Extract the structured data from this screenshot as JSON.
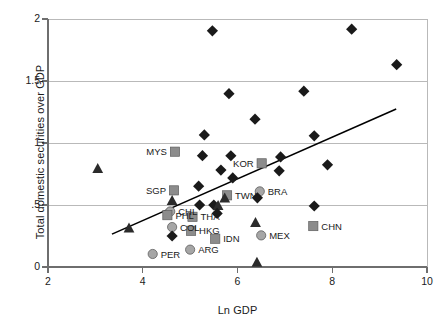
{
  "chart_data": {
    "type": "scatter",
    "title": "",
    "xlabel": "Ln GDP",
    "ylabel": "Total domestic securities over GDP",
    "xlim": [
      2,
      10
    ],
    "ylim": [
      0,
      2
    ],
    "xticks": [
      "2",
      "4",
      "6",
      "8",
      "10"
    ],
    "xtick_values": [
      2,
      4,
      6,
      8,
      10
    ],
    "yticks": [
      "0",
      ".5",
      "1",
      "1.5",
      "2"
    ],
    "ytick_values": [
      0,
      0.5,
      1,
      1.5,
      2
    ],
    "grid": "horizontal",
    "legend": "none",
    "marker_styles": {
      "diamond": {
        "shape": "diamond",
        "color": "#1a1a1a",
        "description": "black diamond"
      },
      "triangle": {
        "shape": "triangle",
        "color": "#2b2b2b",
        "description": "black triangle"
      },
      "square": {
        "shape": "square",
        "color": "#8c8c8c",
        "description": "gray square"
      },
      "circle": {
        "shape": "circle",
        "color": "#a6a6a6",
        "description": "gray circle"
      }
    },
    "trendline": {
      "x1": 3.35,
      "y1": 0.265,
      "x2": 9.35,
      "y2": 1.275,
      "color": "#000000"
    },
    "points": [
      {
        "label": "",
        "x": 5.47,
        "y": 1.905,
        "marker": "diamond"
      },
      {
        "label": "",
        "x": 8.41,
        "y": 1.918,
        "marker": "diamond"
      },
      {
        "label": "",
        "x": 9.36,
        "y": 1.632,
        "marker": "diamond"
      },
      {
        "label": "",
        "x": 5.82,
        "y": 1.398,
        "marker": "diamond"
      },
      {
        "label": "",
        "x": 7.4,
        "y": 1.418,
        "marker": "diamond"
      },
      {
        "label": "",
        "x": 6.37,
        "y": 1.192,
        "marker": "diamond"
      },
      {
        "label": "",
        "x": 5.3,
        "y": 1.065,
        "marker": "diamond"
      },
      {
        "label": "",
        "x": 7.62,
        "y": 1.058,
        "marker": "diamond"
      },
      {
        "label": "MYS",
        "x": 4.68,
        "y": 0.93,
        "marker": "square",
        "label_pos": "left"
      },
      {
        "label": "",
        "x": 5.26,
        "y": 0.898,
        "marker": "diamond"
      },
      {
        "label": "",
        "x": 5.86,
        "y": 0.897,
        "marker": "diamond"
      },
      {
        "label": "",
        "x": 6.91,
        "y": 0.888,
        "marker": "diamond"
      },
      {
        "label": "KOR",
        "x": 6.51,
        "y": 0.836,
        "marker": "square",
        "label_pos": "left"
      },
      {
        "label": "",
        "x": 7.9,
        "y": 0.824,
        "marker": "diamond"
      },
      {
        "label": "",
        "x": 3.05,
        "y": 0.795,
        "marker": "triangle"
      },
      {
        "label": "",
        "x": 5.65,
        "y": 0.782,
        "marker": "diamond"
      },
      {
        "label": "",
        "x": 6.88,
        "y": 0.776,
        "marker": "diamond"
      },
      {
        "label": "",
        "x": 5.9,
        "y": 0.718,
        "marker": "diamond"
      },
      {
        "label": "",
        "x": 5.18,
        "y": 0.652,
        "marker": "diamond"
      },
      {
        "label": "SGP",
        "x": 4.66,
        "y": 0.618,
        "marker": "square",
        "label_pos": "left"
      },
      {
        "label": "BRA",
        "x": 6.47,
        "y": 0.61,
        "marker": "circle",
        "label_pos": "right"
      },
      {
        "label": "TWN",
        "x": 5.78,
        "y": 0.578,
        "marker": "square",
        "label_pos": "right"
      },
      {
        "label": "",
        "x": 6.42,
        "y": 0.558,
        "marker": "diamond"
      },
      {
        "label": "",
        "x": 4.62,
        "y": 0.538,
        "marker": "triangle"
      },
      {
        "label": "",
        "x": 5.73,
        "y": 0.558,
        "marker": "triangle"
      },
      {
        "label": "",
        "x": 5.2,
        "y": 0.5,
        "marker": "diamond"
      },
      {
        "label": "",
        "x": 5.5,
        "y": 0.5,
        "marker": "diamond"
      },
      {
        "label": "",
        "x": 5.59,
        "y": 0.497,
        "marker": "triangle"
      },
      {
        "label": "",
        "x": 7.62,
        "y": 0.492,
        "marker": "diamond"
      },
      {
        "label": "CHL",
        "x": 4.58,
        "y": 0.448,
        "marker": "circle",
        "label_pos": "right"
      },
      {
        "label": "",
        "x": 5.57,
        "y": 0.432,
        "marker": "diamond"
      },
      {
        "label": "PHL",
        "x": 4.52,
        "y": 0.418,
        "marker": "square",
        "label_pos": "right"
      },
      {
        "label": "THA",
        "x": 5.05,
        "y": 0.405,
        "marker": "square",
        "label_pos": "right"
      },
      {
        "label": "",
        "x": 6.38,
        "y": 0.36,
        "marker": "triangle"
      },
      {
        "label": "CHN",
        "x": 7.6,
        "y": 0.33,
        "marker": "square",
        "label_pos": "right"
      },
      {
        "label": "COL",
        "x": 4.62,
        "y": 0.322,
        "marker": "circle",
        "label_pos": "right"
      },
      {
        "label": "",
        "x": 3.71,
        "y": 0.315,
        "marker": "triangle"
      },
      {
        "label": "HKG",
        "x": 5.02,
        "y": 0.292,
        "marker": "square",
        "label_pos": "right"
      },
      {
        "label": "MEX",
        "x": 6.5,
        "y": 0.255,
        "marker": "circle",
        "label_pos": "right"
      },
      {
        "label": "",
        "x": 4.62,
        "y": 0.25,
        "marker": "diamond"
      },
      {
        "label": "IDN",
        "x": 5.53,
        "y": 0.228,
        "marker": "square",
        "label_pos": "right"
      },
      {
        "label": "ARG",
        "x": 5.0,
        "y": 0.14,
        "marker": "circle",
        "label_pos": "right"
      },
      {
        "label": "PER",
        "x": 4.21,
        "y": 0.105,
        "marker": "circle",
        "label_pos": "right"
      },
      {
        "label": "",
        "x": 6.41,
        "y": 0.04,
        "marker": "triangle"
      }
    ]
  }
}
